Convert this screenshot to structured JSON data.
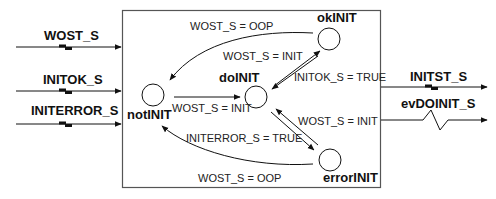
{
  "diagram": {
    "block": {
      "inputs": [
        {
          "label": "WOST_S",
          "type": "data"
        },
        {
          "label": "INITOK_S",
          "type": "data"
        },
        {
          "label": "INITERROR_S",
          "type": "data"
        }
      ],
      "outputs": [
        {
          "label": "INITST_S",
          "type": "data"
        },
        {
          "label": "evDOINIT_S",
          "type": "event"
        }
      ]
    },
    "states": {
      "notINIT": "notINIT",
      "doINIT": "doINIT",
      "okINIT": "okINIT",
      "errorINIT": "errorINIT"
    },
    "transitions": {
      "ok_to_not": "WOST_S = OOP",
      "do_to_ok": "WOST_S  = INIT",
      "ok_to_do": "INITOK_S = TRUE",
      "not_to_do": "WOST_S  = INIT",
      "do_to_error": "WOST_S  = INIT",
      "error_to_do": "INITERROR_S = TRUE",
      "error_to_not": "WOST_S  = OOP"
    }
  }
}
